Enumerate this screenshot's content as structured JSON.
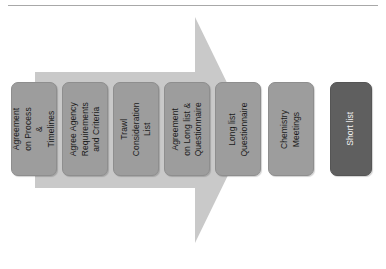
{
  "diagram": {
    "orientation": "left-to-right",
    "top_rule": "horizontal-divider",
    "arrow": {
      "name": "process-arrow",
      "direction": "right",
      "color": "#c9c9c9"
    },
    "colors": {
      "stage_fill": "#9d9d9d",
      "final_fill": "#5f5f5f",
      "arrow_fill": "#c9c9c9",
      "text": "#1a1a1a",
      "final_text": "#f2f2f2",
      "rule": "#a8a8a8",
      "background": "#ffffff"
    },
    "stages": [
      {
        "label": "Agreement\non Process &\nTimelines",
        "kind": "step"
      },
      {
        "label": "Agree Agency\nRequirements\nand Criteria",
        "kind": "step"
      },
      {
        "label": "Trawl\nConsideration\nList",
        "kind": "step"
      },
      {
        "label": "Agreement\non Long list &\nQuestionnaire",
        "kind": "step"
      },
      {
        "label": "Long list\nQuestionnaire",
        "kind": "step"
      },
      {
        "label": "Chemistry\nMeetings",
        "kind": "step"
      },
      {
        "label": "Short list",
        "kind": "outcome"
      }
    ]
  }
}
